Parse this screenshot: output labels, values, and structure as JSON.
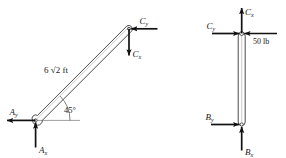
{
  "figure": {
    "type": "free-body-diagram",
    "stroke_color": "#111111",
    "member_fill_color": "#fdfdfd",
    "member_stroke_color": "#3a3a3a",
    "text_color": "#1a1a1a",
    "background_color": "#ffffff"
  },
  "left_diagram": {
    "name": "member-ac-fbd",
    "member": {
      "name": "inclined-member-ac",
      "orientation": "45-degree-incline",
      "start_joint": "A",
      "end_joint": "C"
    },
    "dimension": {
      "name": "member-length",
      "text": "6 √2 ft",
      "value": "6√2",
      "unit": "ft"
    },
    "angle": {
      "name": "incline-angle",
      "text": "45°",
      "value": "45",
      "unit": "deg"
    },
    "forces": [
      {
        "name": "force-ay",
        "base": "A",
        "sub": "y",
        "direction": "left",
        "at_joint": "A"
      },
      {
        "name": "force-ax",
        "base": "A",
        "sub": "x",
        "direction": "up",
        "at_joint": "A"
      },
      {
        "name": "force-cy",
        "base": "C",
        "sub": "y",
        "direction": "left",
        "at_joint": "C"
      },
      {
        "name": "force-cx",
        "base": "C",
        "sub": "x",
        "direction": "down",
        "at_joint": "C"
      }
    ]
  },
  "right_diagram": {
    "name": "member-bc-fbd",
    "member": {
      "name": "vertical-member-bc",
      "orientation": "vertical",
      "start_joint": "B",
      "end_joint": "C"
    },
    "forces": [
      {
        "name": "force-cx",
        "base": "C",
        "sub": "x",
        "direction": "up",
        "at_joint": "C"
      },
      {
        "name": "force-cy",
        "base": "C",
        "sub": "y",
        "direction": "right",
        "at_joint": "C"
      },
      {
        "name": "force-by",
        "base": "B",
        "sub": "y",
        "direction": "right",
        "at_joint": "B"
      },
      {
        "name": "force-bx",
        "base": "B",
        "sub": "x",
        "direction": "up",
        "at_joint": "B"
      }
    ],
    "applied_load": {
      "name": "applied-load-50lb",
      "text": "50 lb",
      "value": "50",
      "unit": "lb",
      "direction": "left",
      "at_joint": "C"
    }
  }
}
